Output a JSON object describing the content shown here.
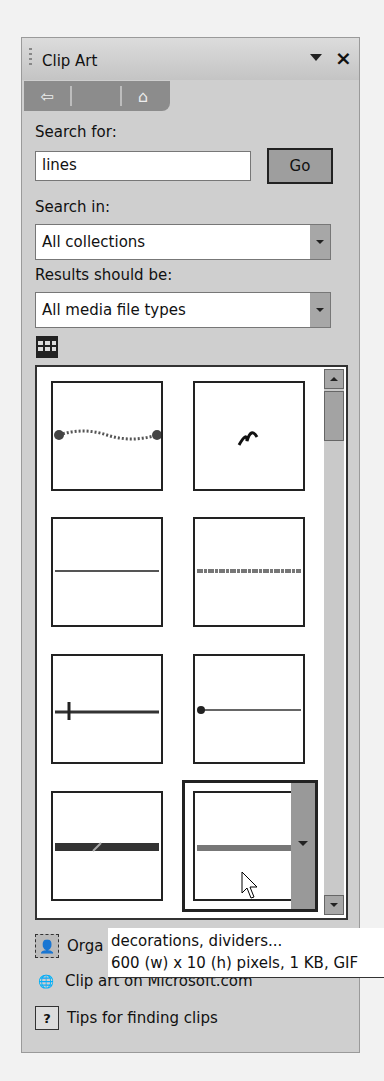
{
  "pane": {
    "title": "Clip Art",
    "menu_icon": "dropdown-triangle",
    "close_icon": "x"
  },
  "nav": {
    "back_icon": "back-arrow",
    "forward_icon": "blank",
    "home_icon": "home"
  },
  "search": {
    "label": "Search for:",
    "value": "lines",
    "go_label": "Go"
  },
  "search_in": {
    "label": "Search in:",
    "value": "All collections"
  },
  "results_type": {
    "label": "Results should be:",
    "value": "All media file types"
  },
  "results": {
    "view_icon": "grid-view",
    "tiles": [
      {
        "kind": "dotted-wave-with-endpoints"
      },
      {
        "kind": "squiggle"
      },
      {
        "kind": "thin-line"
      },
      {
        "kind": "textured-line"
      },
      {
        "kind": "line-with-tick"
      },
      {
        "kind": "line-with-dot"
      },
      {
        "kind": "thick-gradient-bar"
      },
      {
        "kind": "gray-line-selected",
        "selected": true
      }
    ]
  },
  "tooltip": {
    "line1": "decorations, dividers...",
    "line2": "600 (w) x 10 (h) pixels, 1 KB, GIF"
  },
  "links": [
    {
      "label": "Organize clips...",
      "visible_label": "Orga",
      "icon": "organizer"
    },
    {
      "label": "Clip art on Microsoft.com",
      "icon": "globe"
    },
    {
      "label": "Tips for finding clips",
      "icon": "help"
    }
  ]
}
